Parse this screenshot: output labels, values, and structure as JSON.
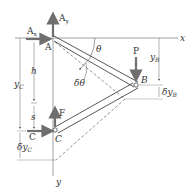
{
  "diagram": {
    "axes": {
      "x_label": "x",
      "y_label": "y"
    },
    "points": {
      "A": "A",
      "B": "B",
      "C_joint": "C",
      "C_force": "C"
    },
    "forces": {
      "Ax": "A",
      "Ax_sub": "x",
      "Ay": "A",
      "Ay_sub": "y",
      "P": "P",
      "F": "F",
      "C": "C"
    },
    "angles": {
      "theta": "θ",
      "delta_theta": "δθ"
    },
    "dimensions": {
      "h": "h",
      "s": "s",
      "yB": "y",
      "yB_sub": "B",
      "dyB": "δy",
      "dyB_sub": "B",
      "yC": "y",
      "yC_sub": "C",
      "dyC": "δy",
      "dyC_sub": "C"
    },
    "colors": {
      "force_arrow": "#6e6e6e",
      "line": "#555555",
      "member": "#444444"
    }
  }
}
